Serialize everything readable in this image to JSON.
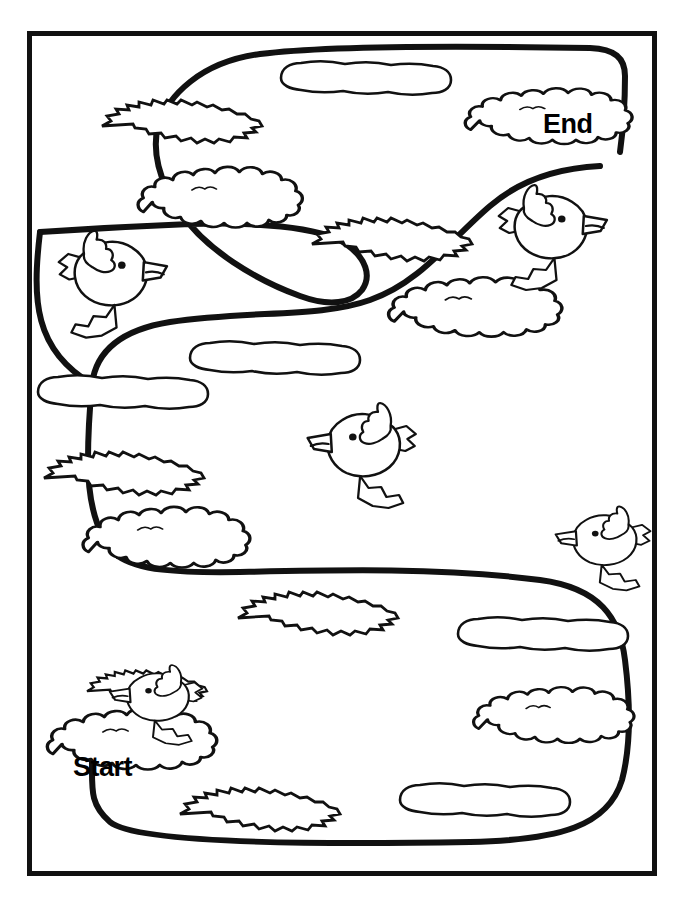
{
  "worksheet": {
    "type": "maze-puzzle-coloring-page",
    "title_text": "",
    "start_label": "Start",
    "end_label": "End",
    "colors": {
      "ink": "#111111",
      "paper": "#ffffff",
      "path_stroke": "#111111",
      "decor_stroke": "#111111"
    },
    "frame": {
      "x": 27,
      "y": 31,
      "width": 630,
      "height": 845,
      "stroke_width": 5
    },
    "path": {
      "stroke_width": 6,
      "description": "winding serpentine trail from Start (bottom left) to End (top right)"
    },
    "decorations": {
      "bird_count": 6,
      "puffy_cloud_count": 6,
      "grass_tuft_count": 6,
      "thin_oval_cloud_count": 5,
      "bird_names": [
        "bird-left-upper",
        "bird-right-upper",
        "bird-center",
        "bird-right-lower",
        "bird-left-lower",
        "bird-right-mid"
      ]
    }
  }
}
